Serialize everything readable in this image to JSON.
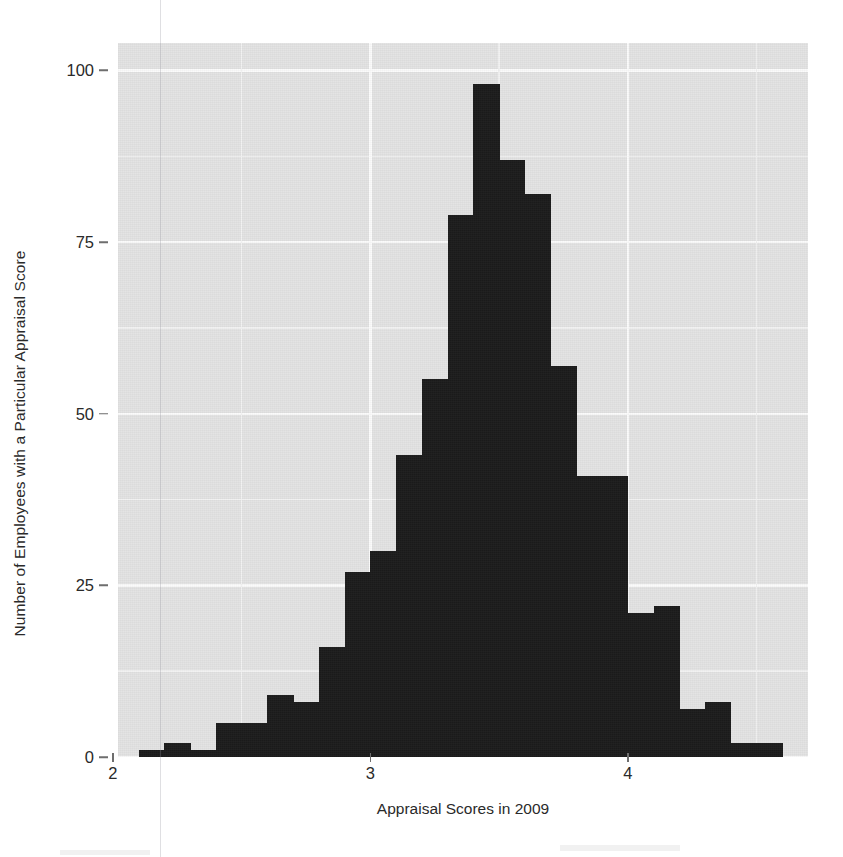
{
  "chart_data": {
    "type": "bar",
    "title": "",
    "subtitle": "",
    "xlabel": "Appraisal Scores in 2009",
    "ylabel": "Number of Employees with a Particular Appraisal Score",
    "xlim": [
      2.02,
      4.7
    ],
    "ylim": [
      0,
      104
    ],
    "xticks": [
      2,
      3,
      4
    ],
    "xticklabels": [
      "2",
      "3",
      "4"
    ],
    "yticks": [
      0,
      25,
      50,
      75,
      100
    ],
    "yticklabels": [
      "0",
      "25",
      "50",
      "75",
      "100"
    ],
    "x_minor_gridlines": [
      2.5,
      3.5,
      4.5
    ],
    "y_minor_gridlines": [
      12.5,
      37.5,
      62.5,
      87.5
    ],
    "grid": true,
    "legend": null,
    "bin_width": 0.1,
    "bar_color": "#1c1c1c",
    "panel_color": "#e3e3e3",
    "gridline_color": "#fbfbfb",
    "categories": [
      "2.15",
      "2.25",
      "2.35",
      "2.45",
      "2.55",
      "2.65",
      "2.75",
      "2.85",
      "2.95",
      "3.05",
      "3.15",
      "3.25",
      "3.35",
      "3.45",
      "3.55",
      "3.65",
      "3.75",
      "3.85",
      "3.95",
      "4.05",
      "4.15",
      "4.25",
      "4.35",
      "4.45",
      "4.55"
    ],
    "bin_starts": [
      2.1,
      2.2,
      2.3,
      2.4,
      2.5,
      2.6,
      2.7,
      2.8,
      2.9,
      3.0,
      3.1,
      3.2,
      3.3,
      3.4,
      3.5,
      3.6,
      3.7,
      3.8,
      3.9,
      4.0,
      4.1,
      4.2,
      4.3,
      4.4,
      4.5
    ],
    "values": [
      1,
      2,
      1,
      5,
      5,
      9,
      8,
      16,
      27,
      30,
      44,
      55,
      79,
      98,
      87,
      82,
      57,
      41,
      41,
      21,
      22,
      7,
      8,
      2,
      2
    ]
  },
  "axes": {
    "y_title": "Number of Employees with a Particular Appraisal Score",
    "x_title": "Appraisal Scores in 2009"
  }
}
